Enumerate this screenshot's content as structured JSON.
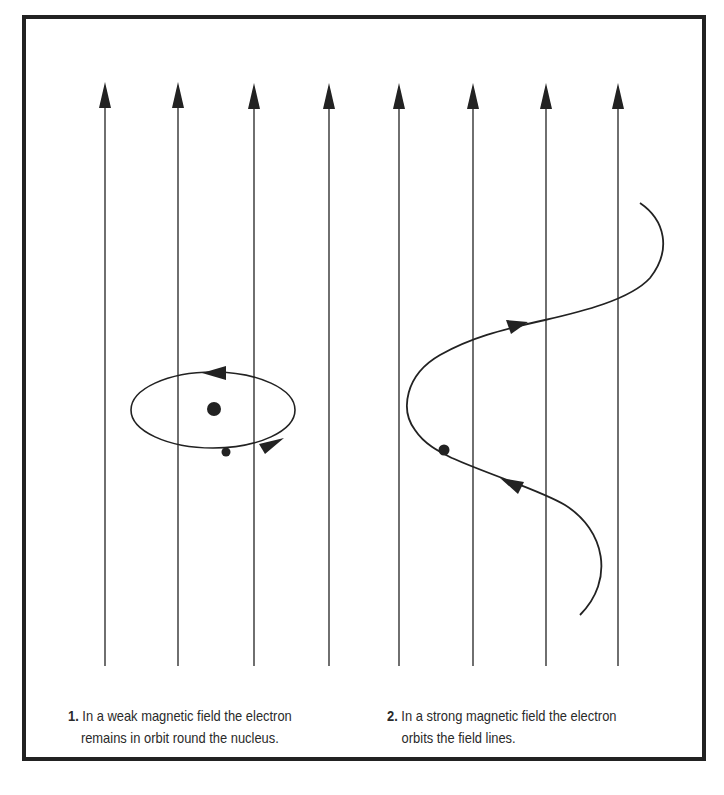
{
  "figure": {
    "field_lines": {
      "count": 8,
      "x_positions": [
        105,
        178,
        254,
        329,
        399,
        473,
        546,
        618
      ],
      "direction": "up",
      "color": "#333333"
    },
    "panel_1": {
      "number": "1.",
      "caption_line1": "In a weak magnetic field the electron",
      "caption_line2": "remains in orbit round the nucleus.",
      "elements": [
        "elliptical-orbit",
        "nucleus",
        "electron",
        "orbit-direction-arrows"
      ]
    },
    "panel_2": {
      "number": "2.",
      "caption_line1": "In a strong magnetic field the electron",
      "caption_line2": "orbits the field lines.",
      "elements": [
        "helical-path",
        "electron",
        "path-direction-arrows"
      ]
    },
    "colors": {
      "ink": "#222222",
      "background": "#ffffff"
    }
  }
}
